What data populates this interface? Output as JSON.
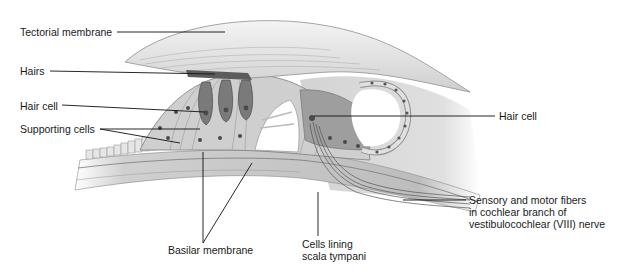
{
  "diagram": {
    "labels": {
      "tectorial_membrane": "Tectorial membrane",
      "hairs": "Hairs",
      "hair_cell_left": "Hair cell",
      "supporting_cells": "Supporting cells",
      "hair_cell_right": "Hair cell",
      "sensory_motor_fibers": [
        "Sensory and motor fibers",
        "in cochlear branch of",
        "vestibulocochlear (VIII) nerve"
      ],
      "basilar_membrane": "Basilar membrane",
      "cells_lining": [
        "Cells lining",
        "scala tympani"
      ]
    },
    "colors": {
      "background": "#ffffff",
      "tissue_light": "#d9d9d9",
      "tissue_mid": "#a8a8a8",
      "tissue_dark": "#6e6e6e",
      "nucleus": "#4a4a4a",
      "leader_line": "#111111"
    }
  }
}
